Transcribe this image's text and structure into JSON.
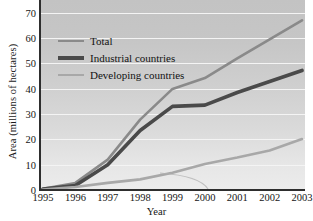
{
  "chart_data": {
    "type": "line",
    "title": "",
    "xlabel": "Year",
    "ylabel": "Area (millions of hectares)",
    "x": [
      1995,
      1996,
      1997,
      1998,
      1999,
      2000,
      2001,
      2002,
      2003
    ],
    "xticklabels": [
      "1995",
      "1996",
      "1997",
      "1998",
      "1999",
      "2000",
      "2001",
      "2002",
      "2003"
    ],
    "yticklabels": [
      "0",
      "10",
      "20",
      "30",
      "40",
      "50",
      "60",
      "70"
    ],
    "yticks": [
      0,
      10,
      20,
      30,
      40,
      50,
      60,
      70
    ],
    "xlim": [
      1995,
      2003
    ],
    "ylim": [
      0,
      75
    ],
    "grid": "horizontal",
    "legend_position": "upper-left",
    "series": [
      {
        "name": "Total",
        "color": "#8a8a8a",
        "width": 2.6,
        "values": [
          0.5,
          2.8,
          12.0,
          27.8,
          39.9,
          44.2,
          52.0,
          59.5,
          67.0
        ]
      },
      {
        "name": "Industrial countries",
        "color": "#4a4a4a",
        "width": 3.6,
        "values": [
          0.4,
          1.8,
          10.0,
          23.5,
          33.0,
          33.5,
          38.5,
          42.8,
          47.2
        ]
      },
      {
        "name": "Developing countries",
        "color": "#a8a8a8",
        "width": 2.6,
        "values": [
          0.2,
          1.2,
          2.8,
          4.2,
          6.8,
          10.3,
          12.8,
          15.6,
          20.1
        ]
      }
    ]
  },
  "legend": {
    "items": [
      {
        "label": "Total"
      },
      {
        "label": "Industrial countries"
      },
      {
        "label": "Developing countries"
      }
    ]
  },
  "axes": {
    "y_title": "Area (millions of hectares)",
    "x_title": "Year"
  },
  "colors": {
    "total": "#8a8a8a",
    "industrial": "#4a4a4a",
    "developing": "#a8a8a8",
    "axis": "#2e2e2e",
    "gridline": "#f4f4f4"
  }
}
